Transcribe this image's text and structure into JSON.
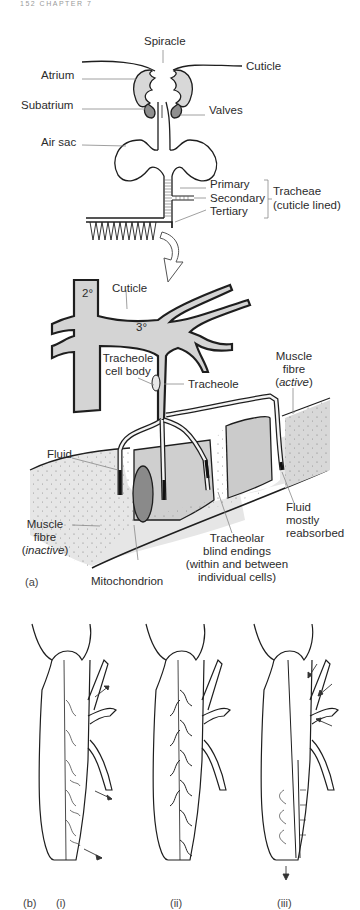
{
  "page_header": "152 CHAPTER 7",
  "figure": {
    "panel_a": {
      "label": "(a)",
      "top_diagram": {
        "labels": {
          "spiracle": "Spiracle",
          "cuticle": "Cuticle",
          "atrium": "Atrium",
          "subatrium": "Subatrium",
          "valves": "Valves",
          "air_sac": "Air sac",
          "primary": "Primary",
          "secondary": "Secondary",
          "tertiary": "Tertiary",
          "tracheae_line1": "Tracheae",
          "tracheae_line2": "(cuticle lined)"
        }
      },
      "detail_diagram": {
        "labels": {
          "secondary_order": "2°",
          "tertiary_order": "3°",
          "cuticle": "Cuticle",
          "tracheole_cell_body_line1": "Tracheole",
          "tracheole_cell_body_line2": "cell body",
          "tracheole": "Tracheole",
          "muscle_active_line1": "Muscle",
          "muscle_active_line2": "fibre",
          "muscle_active_line3": "active",
          "fluid": "Fluid",
          "fluid_reabsorbed_line1": "Fluid",
          "fluid_reabsorbed_line2": "mostly",
          "fluid_reabsorbed_line3": "reabsorbed",
          "muscle_inactive_line1": "Muscle",
          "muscle_inactive_line2": "fibre",
          "muscle_inactive_line3": "inactive",
          "mitochondrion": "Mitochondrion",
          "blind_endings_line1": "Tracheolar",
          "blind_endings_line2": "blind endings",
          "blind_endings_line3": "(within and between",
          "blind_endings_line4": "individual cells)"
        }
      }
    },
    "panel_b": {
      "label": "(b)",
      "sublabels": [
        "(i)",
        "(ii)",
        "(iii)"
      ]
    }
  },
  "colors": {
    "line": "#1e1e1e",
    "tube_fill": "#d4d4d4",
    "muscle_fill": "#e2e2e2",
    "muscle_active_fill": "#c9c9c9",
    "mitochondrion_fill": "#8a8a8a",
    "leader_line": "#888888"
  }
}
